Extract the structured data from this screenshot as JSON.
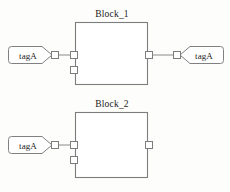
{
  "diagram": {
    "type": "block-diagram",
    "background_color": "#fdfdfb",
    "stroke_color": "#808080",
    "fill_color": "#ffffff",
    "text_color": "#1a1a1a",
    "blocks": [
      {
        "id": "block-1",
        "label": "Block_1",
        "x": 75,
        "y": 22,
        "width": 73,
        "height": 63,
        "input_ports": 2,
        "output_ports": 1
      },
      {
        "id": "block-2",
        "label": "Block_2",
        "x": 75,
        "y": 112,
        "width": 73,
        "height": 66,
        "input_ports": 2,
        "output_ports": 1
      }
    ],
    "tags": [
      {
        "id": "tag-left-top",
        "label": "tagA",
        "orientation": "point-right",
        "x": 8,
        "y": 45,
        "width": 46,
        "height": 17
      },
      {
        "id": "tag-right-top",
        "label": "tagA",
        "orientation": "point-left",
        "x": 178,
        "y": 45,
        "width": 46,
        "height": 17
      },
      {
        "id": "tag-left-bottom",
        "label": "tagA",
        "orientation": "point-right",
        "x": 8,
        "y": 133,
        "width": 46,
        "height": 17
      }
    ],
    "connections": [
      {
        "id": "wire-tag-left-top-to-block-1",
        "from": "tag-left-top",
        "to": "block-1.in1"
      },
      {
        "id": "wire-block-1-to-tag-right-top",
        "from": "block-1.out1",
        "to": "tag-right-top"
      },
      {
        "id": "wire-tag-left-bottom-to-block-2",
        "from": "tag-left-bottom",
        "to": "block-2.in1"
      }
    ]
  }
}
